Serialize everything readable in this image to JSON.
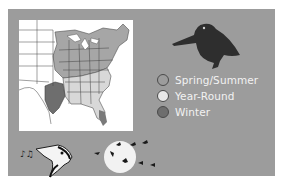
{
  "figure": {
    "type": "range-map",
    "subject_icon": "woodcock-silhouette-icon",
    "colors": {
      "panel_background": "#9c9c9c",
      "map_background": "#ffffff",
      "spring_summer": "#a8a8a8",
      "year_round": "#e6e6e6",
      "winter": "#6e6e6e",
      "bird_silhouette": "#2e2e2e"
    }
  },
  "legend": {
    "items": [
      {
        "label": "Spring/Summer",
        "color": "#9c9c9c"
      },
      {
        "label": "Year-Round",
        "color": "#e8e8e8"
      },
      {
        "label": "Winter",
        "color": "#6e6e6e"
      }
    ]
  },
  "decorations": [
    {
      "icon": "singing-bird-head-icon"
    },
    {
      "icon": "moon-with-migrating-flock-icon"
    }
  ]
}
